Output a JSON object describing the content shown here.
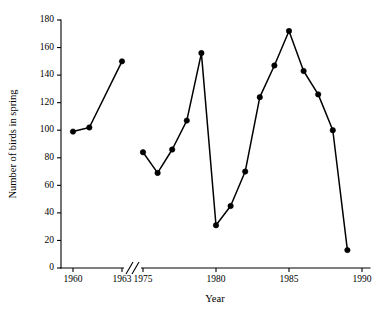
{
  "chart_data": {
    "type": "line",
    "title": "",
    "xlabel": "Year",
    "ylabel": "Number of birds in spring",
    "ylim": [
      0,
      180
    ],
    "y_ticks": [
      0,
      20,
      40,
      60,
      80,
      100,
      120,
      140,
      160,
      180
    ],
    "x_ticks": [
      1960,
      1963,
      1975,
      1980,
      1985,
      1990
    ],
    "grid": false,
    "legend": "none",
    "axis_break": {
      "between": [
        1963,
        1975
      ],
      "marker": "double-slash"
    },
    "series": [
      {
        "name": "Early period",
        "x": [
          1960,
          1961,
          1963
        ],
        "values": [
          99,
          102,
          150
        ]
      },
      {
        "name": "Late period",
        "x": [
          1975,
          1976,
          1977,
          1978,
          1979,
          1980,
          1981,
          1982,
          1983,
          1984,
          1985,
          1986,
          1987,
          1988,
          1989
        ],
        "values": [
          84,
          69,
          86,
          107,
          156,
          31,
          45,
          70,
          124,
          147,
          172,
          143,
          126,
          100,
          13
        ]
      }
    ]
  },
  "axis_labels": {
    "y_tick_texts": [
      "0",
      "20",
      "40",
      "60",
      "80",
      "100",
      "120",
      "140",
      "160",
      "180"
    ],
    "x_tick_texts": [
      "1960",
      "1963",
      "1975",
      "1980",
      "1985",
      "1990"
    ],
    "x_title": "Year",
    "y_title": "Number of birds in spring"
  }
}
